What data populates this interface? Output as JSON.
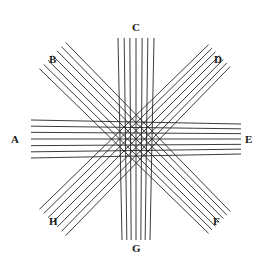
{
  "figure": {
    "background_color": "#ffffff",
    "line_color": "#262626",
    "width": 264,
    "height": 261,
    "center": {
      "x": 136,
      "y": 139
    }
  },
  "labels": {
    "A": "A",
    "B": "B",
    "C": "C",
    "D": "D",
    "E": "E",
    "F": "F",
    "G": "G",
    "H": "H"
  },
  "chart_data": {
    "type": "diagram",
    "xlabel": "",
    "ylabel": "",
    "xlim": [
      0,
      264
    ],
    "ylim": [
      0,
      261
    ],
    "grid": false,
    "legend": "none",
    "annotations": [
      {
        "label": "A",
        "x": 16,
        "y": 139,
        "position": "left"
      },
      {
        "label": "B",
        "x": 54,
        "y": 59,
        "position": "upper-left"
      },
      {
        "label": "C",
        "x": 136,
        "y": 27,
        "position": "top"
      },
      {
        "label": "D",
        "x": 219,
        "y": 59,
        "position": "upper-right"
      },
      {
        "label": "E",
        "x": 250,
        "y": 139,
        "position": "right"
      },
      {
        "label": "F",
        "x": 218,
        "y": 221,
        "position": "lower-right"
      },
      {
        "label": "G",
        "x": 136,
        "y": 248,
        "position": "bottom"
      },
      {
        "label": "H",
        "x": 54,
        "y": 221,
        "position": "lower-left"
      }
    ],
    "series": [
      {
        "name": "band-A-E",
        "orientation": "horizontal",
        "from_label": "A",
        "to_label": "E",
        "line_count": 7,
        "stroke_width": 0.9,
        "color": "#262626",
        "z_order": 3,
        "x_start": 31,
        "x_end": 241,
        "y_offsets": [
          -17,
          -11.5,
          -6,
          0,
          6,
          11.5,
          17
        ],
        "taper": 2.0
      },
      {
        "name": "band-C-G",
        "orientation": "vertical",
        "from_label": "C",
        "to_label": "G",
        "line_count": 7,
        "stroke_width": 0.9,
        "color": "#262626",
        "z_order": 4,
        "y_start": 38,
        "y_end": 240,
        "x_offsets": [
          -16,
          -10.5,
          -5.5,
          0,
          5.5,
          10.5,
          16
        ],
        "taper": 2.0
      },
      {
        "name": "band-B-F",
        "orientation": "diagonal-down-right",
        "from_label": "B",
        "to_label": "F",
        "line_count": 7,
        "stroke_width": 0.9,
        "color": "#262626",
        "z_order": 1,
        "angle_deg": 45,
        "half_length": 118,
        "offsets": [
          -17,
          -11.5,
          -6,
          0,
          6,
          11.5,
          17
        ],
        "taper": 1.6
      },
      {
        "name": "band-D-H",
        "orientation": "diagonal-down-left",
        "from_label": "D",
        "to_label": "H",
        "line_count": 7,
        "stroke_width": 0.9,
        "color": "#262626",
        "z_order": 2,
        "angle_deg": -45,
        "half_length": 118,
        "offsets": [
          -17,
          -11.5,
          -6,
          0,
          6,
          11.5,
          17
        ],
        "taper": 1.6
      }
    ]
  }
}
